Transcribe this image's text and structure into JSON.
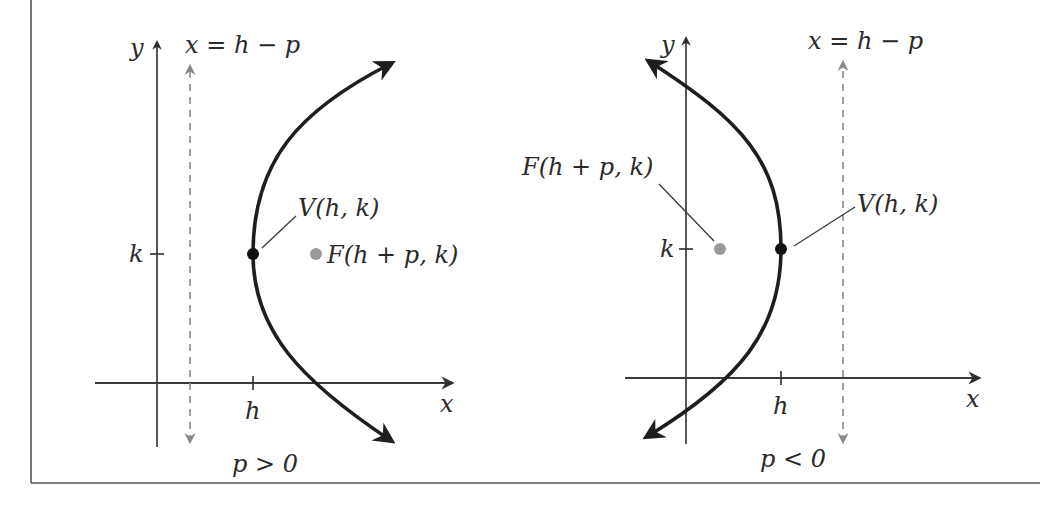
{
  "figure": {
    "colors": {
      "curve": "#1e1e1e",
      "axis": "#2e2e2e",
      "directrix": "#8a8a8a",
      "focus": "#9a9a9a",
      "vertex": "#111111",
      "frame": "#555555"
    },
    "panels": [
      {
        "id": "left",
        "condition": "p > 0",
        "opens": "right",
        "y_axis_label": "y",
        "x_axis_label": "x",
        "tick_h_label": "h",
        "tick_k_label": "k",
        "directrix_label": "x = h − p",
        "vertex_label": "V(h, k)",
        "focus_label": "F(h + p, k)"
      },
      {
        "id": "right",
        "condition": "p < 0",
        "opens": "left",
        "y_axis_label": "y",
        "x_axis_label": "x",
        "tick_h_label": "h",
        "tick_k_label": "k",
        "directrix_label": "x = h − p",
        "vertex_label": "V(h, k)",
        "focus_label": "F(h + p, k)"
      }
    ]
  }
}
